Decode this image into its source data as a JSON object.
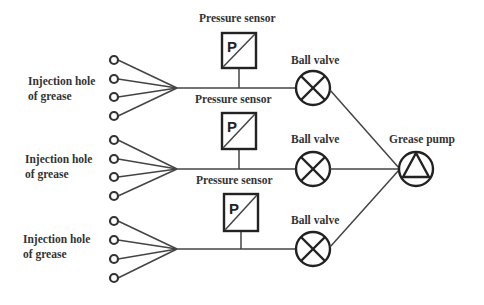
{
  "diagram": {
    "type": "grease injection system schematic",
    "colors": {
      "stroke": "#333333",
      "background": "#ffffff",
      "text": "#333333"
    },
    "branches": [
      {
        "injection_label_line1": "Injection hole",
        "injection_label_line2": "of grease",
        "hole_count": 4,
        "sensor_label": "Pressure sensor",
        "sensor_symbol": "P",
        "valve_label": "Ball valve"
      },
      {
        "injection_label_line1": "Injection hole",
        "injection_label_line2": "of grease",
        "hole_count": 4,
        "sensor_label": "Pressure sensor",
        "sensor_symbol": "P",
        "valve_label": "Ball valve"
      },
      {
        "injection_label_line1": "Injection hole",
        "injection_label_line2": "of grease",
        "hole_count": 4,
        "sensor_label": "Pressure sensor",
        "sensor_symbol": "P",
        "valve_label": "Ball valve"
      }
    ],
    "pump": {
      "label": "Grease pump",
      "icon": "pump-triangle-icon"
    },
    "icons": {
      "hole": "injection-hole-circle-icon",
      "sensor": "pressure-sensor-box-icon",
      "valve": "ball-valve-cross-icon"
    }
  }
}
